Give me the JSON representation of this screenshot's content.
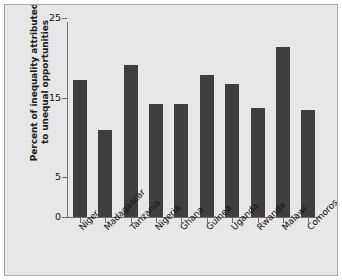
{
  "chart_data": {
    "type": "bar",
    "title": "",
    "xlabel": "",
    "ylabel": "Percent of inequality attributed to unequal opportunities",
    "ylabel_line1": "Percent of inequality attributed",
    "ylabel_line2": "to unequal opportunities",
    "categories": [
      "Niger",
      "Madagascar",
      "Tanzania",
      "Nigeria",
      "Ghana",
      "Guinea",
      "Uganda",
      "Rwanda",
      "Malawi",
      "Comoros"
    ],
    "values": [
      17.2,
      10.9,
      19.1,
      14.2,
      14.2,
      17.8,
      16.7,
      13.7,
      21.3,
      13.5
    ],
    "ylim": [
      0,
      25
    ],
    "yticks": [
      0,
      5,
      15,
      25
    ],
    "ytick_labels": [
      "0",
      "5",
      "15",
      "25"
    ],
    "grid": false,
    "legend": null,
    "bar_color": "#3f3f3f",
    "background_color": "#ececec",
    "axis_color": "#6e6e6e"
  }
}
